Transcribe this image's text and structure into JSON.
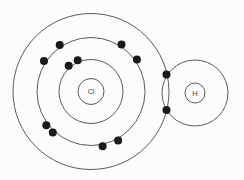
{
  "diagram": {
    "type": "bohr-model-covalent-bond",
    "molecule": "HCl",
    "canvas": {
      "width": 244,
      "height": 180,
      "background": "#fcfcfc"
    },
    "style": {
      "line_color": "#5a5a5a",
      "line_width": 1,
      "electron_color": "#1a1a1a",
      "label_color": "#3c3c3c",
      "electron_radius": 4,
      "electron_orbit_offset": 2
    },
    "atoms": [
      {
        "symbol": "Cl",
        "label": "Cl",
        "cx": 91,
        "cy": 91.5,
        "nucleus_radius": 13,
        "label_font_size": 7,
        "shells": [
          32,
          54,
          78
        ],
        "electrons": [
          {
            "shell": 0,
            "angle": -131
          },
          {
            "shell": 0,
            "angle": -113
          },
          {
            "shell": 1,
            "angle": -147
          },
          {
            "shell": 1,
            "angle": -124
          },
          {
            "shell": 1,
            "angle": -57
          },
          {
            "shell": 1,
            "angle": -35
          },
          {
            "shell": 1,
            "angle": 143
          },
          {
            "shell": 1,
            "angle": 133
          },
          {
            "shell": 1,
            "angle": 78
          },
          {
            "shell": 1,
            "angle": 61
          }
        ]
      },
      {
        "symbol": "H",
        "label": "H",
        "cx": 195,
        "cy": 93,
        "nucleus_radius": 10,
        "label_font_size": 7.5,
        "shells": [
          33
        ],
        "electrons": []
      }
    ],
    "bond": {
      "type": "shared-electron-pair",
      "electrons": [
        {
          "x": 166.5,
          "y": 74.5
        },
        {
          "x": 166.5,
          "y": 110
        }
      ]
    }
  }
}
